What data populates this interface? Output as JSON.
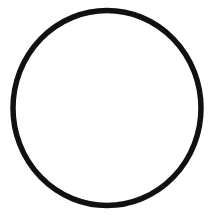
{
  "canvas": {
    "width": 221,
    "height": 220,
    "background_color": "#ffffff"
  },
  "figure": {
    "shapes": [
      {
        "name": "circle-outline",
        "type": "ellipse",
        "center_x": 107,
        "center_y": 108,
        "radius_x": 94,
        "radius_y": 97.5,
        "stroke_color": "#111111",
        "stroke_width": 5.5,
        "fill_color": "none"
      }
    ]
  }
}
